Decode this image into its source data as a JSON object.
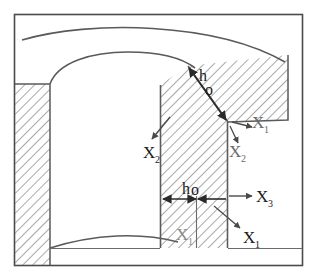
{
  "figure": {
    "kind": "engineering-cross-section",
    "background_color": "#ffffff",
    "line_color": "#4a4a4a",
    "hatch_color": "#7a7a7a",
    "text_color": "#1a1a1a",
    "frame": {
      "name": "outer-border",
      "x": 14,
      "y": 14,
      "width": 289,
      "height": 252
    }
  },
  "labels": {
    "h_nought_diagonal": {
      "letter": "h",
      "subscript": "o"
    },
    "h_nought_horizontal": {
      "letter": "h",
      "subscript": "o"
    },
    "x1_corner": {
      "letter": "X",
      "subscript": "1"
    },
    "x2_corner": {
      "letter": "X",
      "subscript": "2"
    },
    "x2_left": {
      "letter": "X",
      "subscript": "2"
    },
    "x3_right": {
      "letter": "X",
      "subscript": "3"
    },
    "x1_lower_right": {
      "letter": "X",
      "subscript": "1"
    },
    "x1_column_bottom": {
      "letter": "X",
      "subscript": "1"
    }
  }
}
